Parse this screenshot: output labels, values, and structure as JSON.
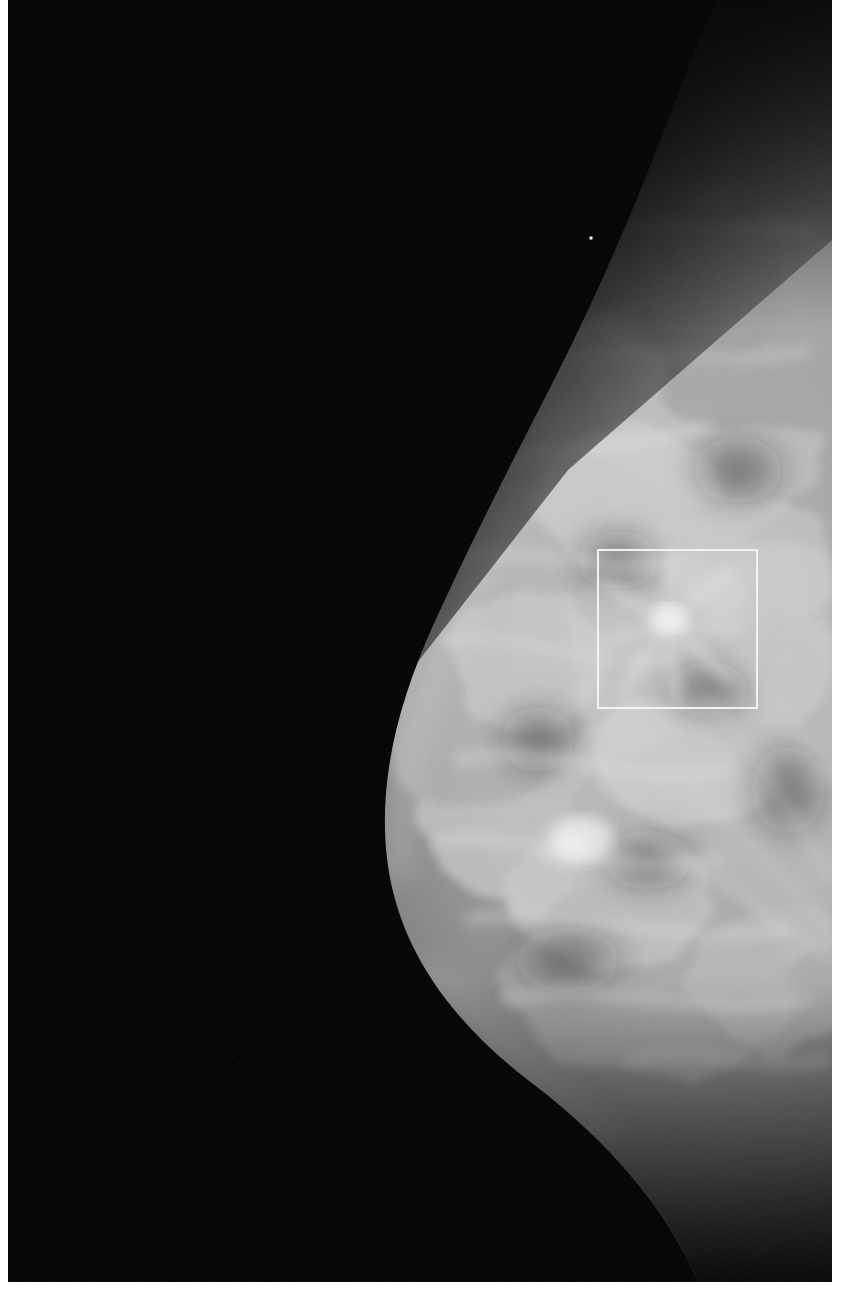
{
  "viewer": {
    "label": "mammogram-viewer",
    "width": 854,
    "height": 1296,
    "background_color": "#ffffff",
    "film_background_color": "#000000"
  },
  "image": {
    "modality_name": "mammogram",
    "view_description": "right breast, craniocaudal-type projection, breast tissue on right side of frame",
    "laterality_hint": "chest wall at right edge, nipple toward left",
    "film_rect": {
      "x": 8,
      "y": 0,
      "width": 824,
      "height": 1282
    },
    "background_color": "#000000",
    "tissue_light_color": "#e8e8e8",
    "tissue_mid_color": "#8d8d8d",
    "tissue_dark_color": "#3a3a3a"
  },
  "annotations": {
    "roi_box": {
      "name": "region-of-interest",
      "shape": "rectangle",
      "stroke_color": "#f2f2f2",
      "stroke_width": 2,
      "fill": "none",
      "x": 597,
      "y": 549,
      "width": 161,
      "height": 160,
      "finding_description": "spiculated mass with radiating strands"
    }
  },
  "findings": [
    {
      "name": "spiculated-mass",
      "x": 668,
      "y": 622,
      "radius": 34,
      "brightness": "high",
      "inside_roi": true
    },
    {
      "name": "rounded-nodule",
      "x": 716,
      "y": 196,
      "radius": 22,
      "brightness": "low-contrast",
      "inside_roi": false
    },
    {
      "name": "bright-speck",
      "x": 591,
      "y": 238,
      "radius": 2,
      "brightness": "very-high",
      "inside_roi": false
    },
    {
      "name": "dense-fibroglandular-focus",
      "x": 571,
      "y": 845,
      "radius": 42,
      "brightness": "high",
      "inside_roi": false
    }
  ],
  "margins": {
    "left_strip_color": "#ffffff",
    "right_strip_color": "#ffffff",
    "bottom_strip_color": "#ffffff"
  }
}
